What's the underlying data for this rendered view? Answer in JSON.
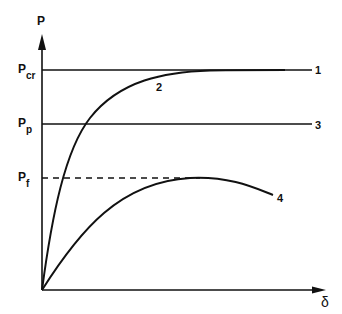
{
  "diagram": {
    "axes": {
      "y_label": "P",
      "x_label": "δ"
    },
    "levels": [
      {
        "id": "pcr",
        "label": "P",
        "subscript": "cr",
        "y": 70,
        "style": "solid",
        "curve_tag": "1"
      },
      {
        "id": "pp",
        "label": "P",
        "subscript": "p",
        "y": 124,
        "style": "solid",
        "curve_tag": "3"
      },
      {
        "id": "pf",
        "label": "P",
        "subscript": "f",
        "y": 178,
        "style": "dashed"
      }
    ],
    "curves": [
      {
        "tag": "1",
        "description": "horizontal line at P_cr"
      },
      {
        "tag": "2",
        "description": "rising curve asymptotically approaching P_cr"
      },
      {
        "tag": "3",
        "description": "horizontal line at P_p"
      },
      {
        "tag": "4",
        "description": "rising curve peaking at P_f then decreasing"
      }
    ],
    "colors": {
      "ink": "#111111",
      "background": "#ffffff"
    }
  }
}
